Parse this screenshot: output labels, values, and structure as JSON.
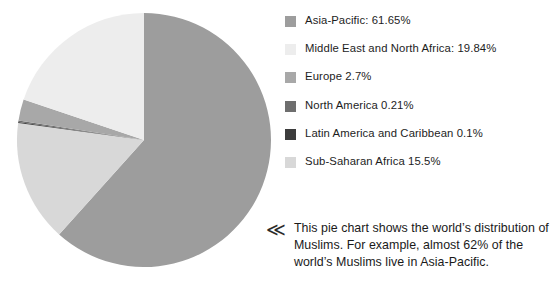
{
  "chart_data": {
    "type": "pie",
    "title": "",
    "subtitle": "",
    "legend_position": "right",
    "start_angle_deg": 0,
    "direction": "clockwise",
    "units": "%",
    "categories": [
      "Asia-Pacific",
      "Middle East and North Africa",
      "Europe",
      "North America",
      "Latin America and Caribbean",
      "Sub-Saharan Africa"
    ],
    "values": [
      61.65,
      19.84,
      2.7,
      0.21,
      0.1,
      15.5
    ],
    "colors": [
      "#9d9d9d",
      "#ededed",
      "#a8a8a8",
      "#6e6e6e",
      "#3c3c3c",
      "#d8d8d8"
    ],
    "draw_order": [
      {
        "name": "Asia-Pacific",
        "value": 61.65,
        "color": "#9d9d9d"
      },
      {
        "name": "Sub-Saharan Africa",
        "value": 15.5,
        "color": "#d8d8d8"
      },
      {
        "name": "Latin America and Caribbean",
        "value": 0.1,
        "color": "#3c3c3c"
      },
      {
        "name": "North America",
        "value": 0.21,
        "color": "#6e6e6e"
      },
      {
        "name": "Europe",
        "value": 2.7,
        "color": "#a8a8a8"
      },
      {
        "name": "Middle East and North Africa",
        "value": 19.84,
        "color": "#ededed"
      }
    ],
    "center": {
      "cx": 144,
      "cy": 140,
      "r": 127
    },
    "annotations": [
      "This pie chart shows the world's distribution of Muslims. For example, almost 62% of the world's Muslims live in Asia-Pacific."
    ]
  },
  "legend": {
    "items": [
      {
        "label": "Asia-Pacific: 61.65%",
        "color": "#9d9d9d",
        "swatch_name": "legend-swatch-asia-pacific"
      },
      {
        "label": "Middle East and North Africa: 19.84%",
        "color": "#ededed",
        "swatch_name": "legend-swatch-middle-east-north-africa"
      },
      {
        "label": "Europe 2.7%",
        "color": "#a8a8a8",
        "swatch_name": "legend-swatch-europe"
      },
      {
        "label": "North America 0.21%",
        "color": "#6e6e6e",
        "swatch_name": "legend-swatch-north-america"
      },
      {
        "label": "Latin America and Caribbean 0.1%",
        "color": "#3c3c3c",
        "swatch_name": "legend-swatch-latin-america-caribbean"
      },
      {
        "label": "Sub-Saharan Africa 15.5%",
        "color": "#d8d8d8",
        "swatch_name": "legend-swatch-sub-saharan-africa"
      }
    ]
  },
  "caption": {
    "chevron": "≪",
    "text": "This pie chart shows the world’s distribution of Muslims. For example, almost 62% of the world’s Muslims live in Asia-Pacific."
  }
}
